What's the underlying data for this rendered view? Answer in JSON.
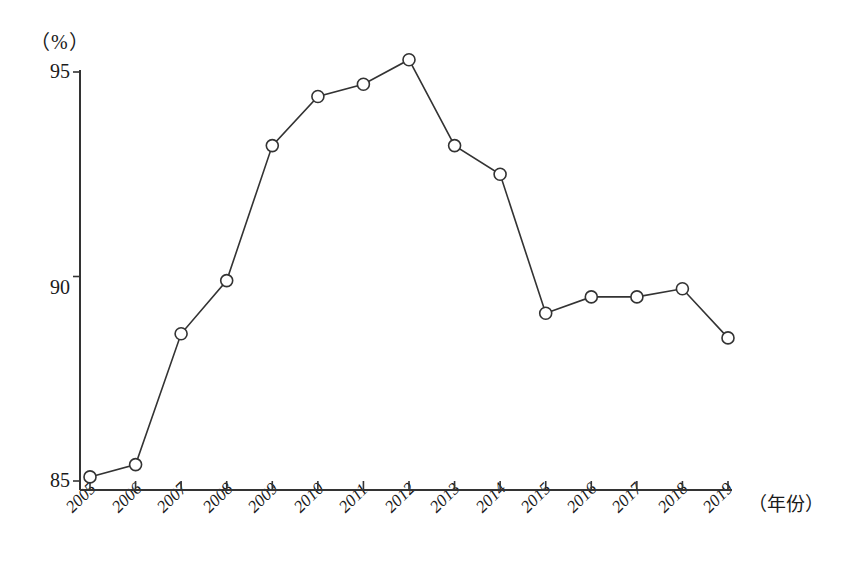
{
  "chart_data": {
    "type": "line",
    "title": "",
    "subtitle": "",
    "xlabel": "（年份）",
    "ylabel": "（%）",
    "categories": [
      "2005",
      "2006",
      "2007",
      "2008",
      "2009",
      "2010",
      "2011",
      "2012",
      "2013",
      "2014",
      "2015",
      "2016",
      "2017",
      "2018",
      "2019"
    ],
    "values": [
      85.1,
      85.4,
      88.6,
      89.9,
      93.2,
      94.4,
      94.7,
      95.3,
      93.2,
      92.5,
      89.1,
      89.5,
      89.5,
      89.7,
      88.5
    ],
    "series": [
      {
        "name": "",
        "values": [
          85.1,
          85.4,
          88.6,
          89.9,
          93.2,
          94.4,
          94.7,
          95.3,
          93.2,
          92.5,
          89.1,
          89.5,
          89.5,
          89.7,
          88.5
        ]
      }
    ],
    "ylim": [
      84.6,
      95.6
    ],
    "xlim": [
      2005,
      2019
    ],
    "yticks": [
      85,
      90,
      95
    ],
    "ytick_labels": [
      "85",
      "90",
      "95"
    ],
    "xticks": [
      2005,
      2006,
      2007,
      2008,
      2009,
      2010,
      2011,
      2012,
      2013,
      2014,
      2015,
      2016,
      2017,
      2018,
      2019
    ],
    "grid": false,
    "legend": "none",
    "marker": "open-circle",
    "line_color": "#333333",
    "marker_fill": "#ffffff",
    "background": "#ffffff"
  },
  "axes": {
    "y_unit_label": "（%）",
    "x_axis_title": "（年份）",
    "ytick_labels": [
      "95",
      "90",
      "85"
    ],
    "xtick_labels": [
      "2005",
      "2006",
      "2007",
      "2008",
      "2009",
      "2010",
      "2011",
      "2012",
      "2013",
      "2014",
      "2015",
      "2016",
      "2017",
      "2018",
      "2019"
    ]
  }
}
